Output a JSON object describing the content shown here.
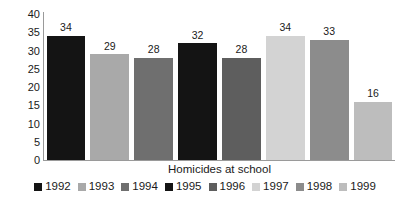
{
  "chart_data": {
    "type": "bar",
    "title": "",
    "subtitle": "",
    "xlabel": "Homicides at school",
    "ylabel": "",
    "categories": [
      "1992",
      "1993",
      "1994",
      "1995",
      "1996",
      "1997",
      "1998",
      "1999"
    ],
    "values": [
      34,
      29,
      28,
      32,
      28,
      34,
      33,
      16
    ],
    "value_labels": [
      "34",
      "29",
      "28",
      "32",
      "28",
      "34",
      "33",
      "16"
    ],
    "colors": [
      "#141414",
      "#a9a9a9",
      "#6f6f6f",
      "#141414",
      "#5e5e5e",
      "#d3d3d3",
      "#8c8c8c",
      "#bdbdbd"
    ],
    "ylim": [
      0,
      40
    ],
    "yticks": [
      40,
      35,
      30,
      25,
      20,
      15,
      10,
      5,
      0
    ],
    "ytick_labels": [
      "40",
      "35",
      "30",
      "25",
      "20",
      "15",
      "10",
      "5",
      "0"
    ],
    "grid": false,
    "legend_position": "bottom",
    "legend": [
      {
        "label": "1992",
        "color": "#141414"
      },
      {
        "label": "1993",
        "color": "#a9a9a9"
      },
      {
        "label": "1994",
        "color": "#6f6f6f"
      },
      {
        "label": "1995",
        "color": "#141414"
      },
      {
        "label": "1996",
        "color": "#5e5e5e"
      },
      {
        "label": "1997",
        "color": "#d3d3d3"
      },
      {
        "label": "1998",
        "color": "#8c8c8c"
      },
      {
        "label": "1999",
        "color": "#bdbdbd"
      }
    ]
  },
  "axis": {
    "line_color": "#9a9a9a"
  }
}
